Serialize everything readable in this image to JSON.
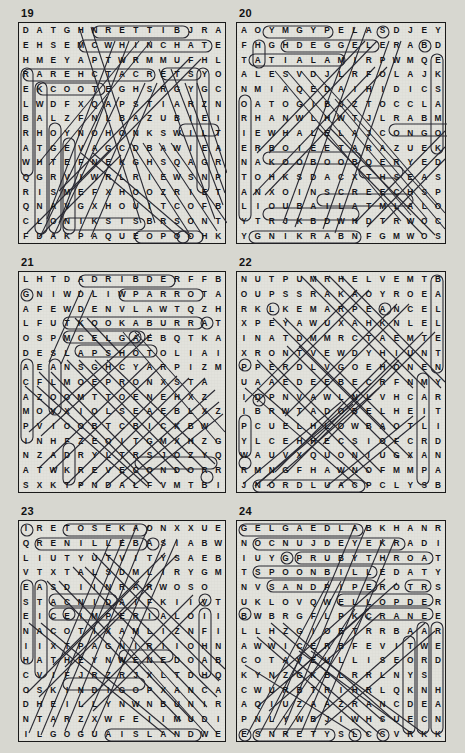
{
  "page": {
    "background_color": "#d7d7d0",
    "ink_color": "#15151a",
    "highlight_color": "#2a2a33",
    "type": "word-search-puzzle-page",
    "puzzle_count": 6,
    "grid_size": "16x16"
  },
  "puzzles": [
    {
      "number": "19",
      "rows": [
        "DATGHNRETTIBJRA",
        "EHSEMCWHINCHATE",
        "HMEYAPTWRMMUFHL",
        "RAREHCTACRETSYO",
        "EKCOOTEGHSRGYGC",
        "LWDFXQAPSTIARZN",
        "BALZFNLBAZUBIEI",
        "RHOYNOHONKSWILT",
        "ATGEVAGCDBAWIEA",
        "WHTEFNEKGHSQAGR",
        "QGRVIWRLRIEWSNP",
        "RISMEFXHOOZRIET",
        "QNAVGXHOUITCOFB",
        "CLONIKSISBRSONT",
        "FDAKPAQUEOPOOHK"
      ],
      "found_words": [
        "BITTERN",
        "WHINCHAT",
        "CATCHER",
        "OYSTERCATCHER",
        "COOT",
        "KINGFISHER",
        "SISKIN",
        "OSPREY",
        "DUNLIN",
        "WREN",
        "SWALLOW",
        "HOOPOE",
        "GOOSE",
        "PETREL",
        "SCAUP"
      ]
    },
    {
      "number": "20",
      "rows": [
        "AOYMGYPELASDJEY",
        "FHGHDEGGELERABD",
        "TATIALAMIRPWMQE",
        "ALESVDJLRFOLAJK",
        "NMIAQEDAIHIDICS",
        "OATOGIBSZTOCCLA",
        "RHANWLHWTJLRABM",
        "IEWHALELAJCONGO",
        "ERBOIEETARAZUEK",
        "NAKOOBOOBQERYED",
        "TOHKSDACXTHSEAS",
        "ANXOINSCREECHSP",
        "LIOUBAILATMLALO",
        "YTRJKBDWHDTRWOC",
        "YGNIKRABNFGMWOS"
      ],
      "found_words": [
        "PYGMY",
        "EAGLE",
        "LEGGED",
        "MALAYSIA",
        "MALAI",
        "CONGO",
        "BOOBOOK",
        "SCREECH",
        "TAILABU",
        "BARKING",
        "TAWNY",
        "WHALE",
        "HAWK",
        "ELF",
        "LITTLE"
      ]
    },
    {
      "number": "21",
      "rows": [
        "LHTDADRIBDERFFB",
        "GNIWDLIWPARROTA",
        "AFEWDENVLAWTQZH",
        "LFUTKOOKABURRAT",
        "OSPMCELGAEBQTKA",
        "DESLAPSHOTOLIAI",
        "AEANSGHCYARPIZM",
        "CFLMOEPRONXSTA",
        "AZOOMTTOENEHXZ",
        "MOVXIOLSEAEBLXZ",
        "PVIOOBTCBICKBW",
        "INHFZEOITGMXHZG",
        "NZADRYLTRSJOZYQ",
        "ATWKREVECONDORR",
        "SXKTPNDALFVMTBI"
      ],
      "found_words": [
        "FIREBIRD",
        "WILDWING",
        "PARROT",
        "KOOKABURRA",
        "EAGLE",
        "SLAPSHOT",
        "CONDOR",
        "HAWK",
        "PENGUIN",
        "SEAHAWK",
        "FALCON",
        "OWL",
        "CROW",
        "RAVEN"
      ]
    },
    {
      "number": "22",
      "rows": [
        "NUTPUMRHELVEMTB",
        "OUPSSRAKAOYROEA",
        "RKLKEMARPEANCEL",
        "XPEYAWUXAHKNLEL",
        "INATDMMRCTAEMTE",
        "XRONTVEWDYHIUNT",
        "PPERDLVGOEHONEN",
        "UAAEDEEBECRFNMY",
        "IDPNVAWLNLVHCAR",
        "IBRWTADOBELHEIT",
        "PCUELHLOWBAOTLI",
        "YLCEHHECSIOFCRD",
        "WAUVXQUONIUGXAN",
        "RMNGFHAWNOFMMPA",
        "JNORDLUACPCLYSB"
      ],
      "found_words": [
        "BALLET",
        "ATTITUDE",
        "CAULDRON",
        "ENTRECHAT",
        "PLIE",
        "ARABESQUE",
        "RELEVE",
        "TURNOUT",
        "PIROUETTE",
        "COUPE",
        "JETE",
        "FOUETTE",
        "ADAGIO",
        "BARRE"
      ]
    },
    {
      "number": "23",
      "rows": [
        "IRETOSEKAONXXUE",
        "QRENILLEBASIABW",
        "LIUTYUTVITYSAEB",
        "VTXTALSDMLIRYGM",
        "EASDIINRARWOSO",
        "STACNIDAIFKIIVT",
        "EICEIMPERIALOII",
        "NACOTIXAMLIZNFI",
        "IIXTPAGNIRIIOHN",
        "HATHEYNWENEDOAB",
        "CVIFJRZRJXLTDHQ",
        "OSKINDIGOPXANCA",
        "DHEILLYNWNBUNIR",
        "NTARZXWFEIIMUDI",
        "ILGOGUAISLANDWE"
      ],
      "found_words": [
        "SABELLINE",
        "IMPERIAL",
        "ISLAND",
        "INDIGO",
        "OAK",
        "TOSE",
        "RING",
        "MEXICO",
        "AUGOGOL",
        "ATHENS",
        "NAPLES"
      ]
    },
    {
      "number": "24",
      "rows": [
        "GELGAEDLABKHANR",
        "NOCNUJDEYEKRADI",
        "IUYGPRUBYTHROAT",
        "TSPOONBILLEDATY",
        "NVSANDPIPEROTRS",
        "UKLOVQWELLOPDER",
        "BWBRGFLPKCRANEE",
        "LLHZGIOETRRBAAR",
        "AWWICERBFEVITWE",
        "COTAVEULLISEORD",
        "KYNZGKBLRRLNYS",
        "CWURBTRIHRLQKNH",
        "AQIUZAAZRANCDEA",
        "PNLYWBJIWHSUECN",
        "ESNRETYSLCSVRKK"
      ],
      "found_words": [
        "BALD",
        "EAGLE",
        "JUNCO",
        "DARKEYED",
        "RUBYTHROAT",
        "SPOONBILLED",
        "SANDPIPER",
        "CRANE",
        "DOWITCHER",
        "TERNS",
        "STILT",
        "AVOCET",
        "WREN",
        "OYSTERCATCHER"
      ]
    }
  ]
}
